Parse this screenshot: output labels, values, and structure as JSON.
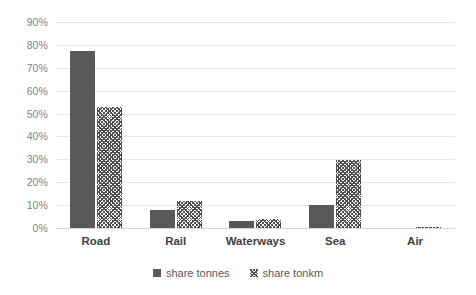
{
  "chart_data": {
    "type": "bar",
    "title": "",
    "subtitle": "",
    "xlabel": "",
    "ylabel": "",
    "categories": [
      "Road",
      "Rail",
      "Waterways",
      "Sea",
      "Air"
    ],
    "series": [
      {
        "name": "share tonnes",
        "style": "solid",
        "color": "#595959",
        "values": [
          77.5,
          8.0,
          3.0,
          10.0,
          0.0
        ]
      },
      {
        "name": "share tonkm",
        "style": "diagonal-crosshatch",
        "color": "#4d4d4d",
        "values": [
          53.0,
          12.0,
          4.0,
          29.5,
          0.4
        ]
      }
    ],
    "ylim": [
      0,
      90
    ],
    "ytick_values": [
      0,
      10,
      20,
      30,
      40,
      50,
      60,
      70,
      80,
      90
    ],
    "ytick_labels": [
      "0%",
      "10%",
      "20%",
      "30%",
      "40%",
      "50%",
      "60%",
      "70%",
      "80%",
      "90%"
    ],
    "grid": true,
    "grid_axis": "y",
    "grid_color": "#e8e8e8",
    "legend_position": "bottom",
    "background_color": "#ffffff",
    "value_format": "percent"
  },
  "legend": {
    "entries": [
      {
        "label": "share tonnes"
      },
      {
        "label": "share tonkm"
      }
    ]
  }
}
